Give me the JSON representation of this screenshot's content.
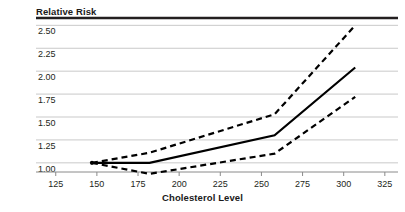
{
  "chart_data": {
    "type": "line",
    "title": "Relative Risk",
    "subtitle": "",
    "xlabel": "Cholesterol Level",
    "ylabel": "Relative Risk",
    "xlim": [
      113,
      333
    ],
    "ylim": [
      0.9,
      2.58
    ],
    "xticks": [
      125,
      150,
      175,
      200,
      225,
      250,
      275,
      300,
      325
    ],
    "yticks": [
      1.0,
      1.25,
      1.5,
      1.75,
      2.0,
      2.25,
      2.5
    ],
    "ytick_labels": [
      "1.00",
      "1.25",
      "1.50",
      "1.75",
      "2.00",
      "2.25",
      "2.50"
    ],
    "xtick_labels": [
      "125",
      "150",
      "175",
      "200",
      "225",
      "250",
      "275",
      "300",
      "325"
    ],
    "grid": "horizontal",
    "legend": "none",
    "reference_point": {
      "x": 147,
      "y": 1.0
    },
    "series": [
      {
        "name": "Relative risk (point estimate)",
        "style": "solid",
        "color": "#000000",
        "x": [
          147,
          182,
          258,
          307
        ],
        "values": [
          1.0,
          1.0,
          1.3,
          2.04
        ]
      },
      {
        "name": "Upper confidence limit",
        "style": "dashed",
        "color": "#000000",
        "x": [
          147,
          182,
          258,
          307
        ],
        "values": [
          1.0,
          1.11,
          1.53,
          2.5
        ]
      },
      {
        "name": "Lower confidence limit",
        "style": "dashed",
        "color": "#000000",
        "x": [
          147,
          182,
          258,
          307
        ],
        "values": [
          1.0,
          0.88,
          1.1,
          1.72
        ]
      }
    ]
  },
  "colors": {
    "axis": "#231f20",
    "grid": "#c9c9c9",
    "top_border": "#231f20",
    "line": "#000000",
    "text": "#231f20"
  }
}
